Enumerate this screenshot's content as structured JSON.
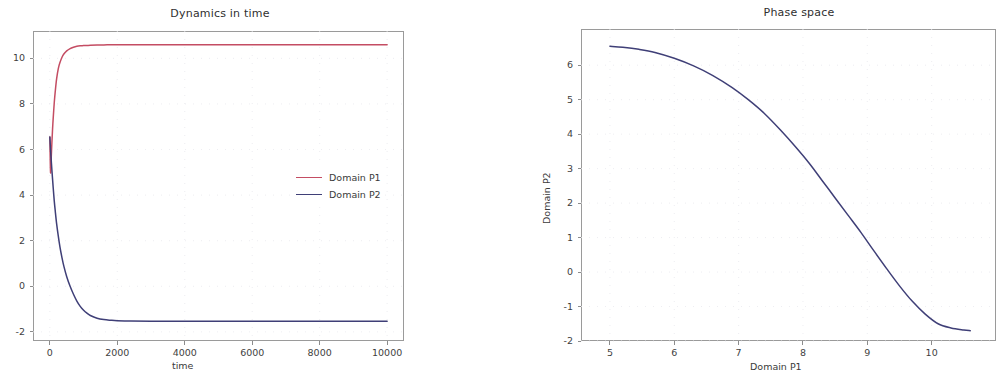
{
  "figure": {
    "width": 938,
    "height": 377,
    "background": "#ffffff"
  },
  "colors": {
    "p1": "#c44d63",
    "p2": "#3f3f77",
    "axis": "#9a9a9a",
    "grid": "#e8e8ee",
    "text": "#3a3a3a"
  },
  "chart_data": [
    {
      "type": "line",
      "id": "dynamics-in-time",
      "title": "Dynamics in time",
      "xlabel": "time",
      "ylabel": "",
      "xlim": [
        -500,
        10500
      ],
      "ylim": [
        -2.4,
        11.2
      ],
      "xticks": [
        0,
        2000,
        4000,
        6000,
        8000,
        10000
      ],
      "xtick_labels": [
        "0",
        "2000",
        "4000",
        "6000",
        "8000",
        "10000"
      ],
      "yticks": [
        -2,
        0,
        2,
        4,
        6,
        8,
        10
      ],
      "ytick_labels": [
        "-2",
        "0",
        "2",
        "4",
        "6",
        "8",
        "10"
      ],
      "grid": true,
      "legend_position": "center right",
      "series": [
        {
          "name": "Domain P1",
          "color": "#c44d63",
          "x": [
            0,
            20,
            40,
            60,
            80,
            100,
            130,
            160,
            200,
            250,
            300,
            360,
            420,
            500,
            600,
            700,
            800,
            900,
            1000,
            1200,
            1400,
            1600,
            1800,
            2000,
            2400,
            3000,
            4000,
            5000,
            6000,
            7000,
            8000,
            9000,
            10000
          ],
          "y": [
            6.55,
            5.0,
            5.62,
            6.3,
            6.9,
            7.4,
            8.05,
            8.55,
            9.1,
            9.55,
            9.82,
            10.05,
            10.2,
            10.33,
            10.43,
            10.49,
            10.53,
            10.55,
            10.56,
            10.58,
            10.59,
            10.59,
            10.6,
            10.6,
            10.6,
            10.6,
            10.6,
            10.6,
            10.6,
            10.6,
            10.6,
            10.6,
            10.6
          ]
        },
        {
          "name": "Domain P2",
          "color": "#3f3f77",
          "x": [
            0,
            20,
            40,
            60,
            80,
            100,
            130,
            160,
            200,
            250,
            300,
            360,
            420,
            500,
            600,
            700,
            800,
            900,
            1000,
            1100,
            1200,
            1400,
            1600,
            1800,
            2000,
            2400,
            3000,
            4000,
            5000,
            6000,
            7000,
            8000,
            9000,
            10000
          ],
          "y": [
            6.55,
            6.0,
            5.55,
            5.1,
            4.7,
            4.3,
            3.75,
            3.3,
            2.75,
            2.2,
            1.72,
            1.25,
            0.85,
            0.42,
            0.0,
            -0.35,
            -0.65,
            -0.88,
            -1.05,
            -1.18,
            -1.28,
            -1.4,
            -1.46,
            -1.49,
            -1.51,
            -1.52,
            -1.53,
            -1.53,
            -1.53,
            -1.53,
            -1.53,
            -1.53,
            -1.53,
            -1.53
          ]
        }
      ]
    },
    {
      "type": "line",
      "id": "phase-space",
      "title": "Phase space",
      "xlabel": "Domain P1",
      "ylabel": "Domain P2",
      "xlim": [
        4.55,
        11.0
      ],
      "ylim": [
        -2.0,
        7.05
      ],
      "xticks": [
        5,
        6,
        7,
        8,
        9,
        10
      ],
      "xtick_labels": [
        "5",
        "6",
        "7",
        "8",
        "9",
        "10"
      ],
      "yticks": [
        -2,
        -1,
        0,
        1,
        2,
        3,
        4,
        5,
        6
      ],
      "ytick_labels": [
        "-2",
        "-1",
        "0",
        "1",
        "2",
        "3",
        "4",
        "5",
        "6"
      ],
      "grid": true,
      "legend_position": "none",
      "series": [
        {
          "name": "trajectory",
          "color": "#3f3f77",
          "x": [
            5.0,
            5.2,
            5.45,
            5.7,
            6.0,
            6.3,
            6.6,
            6.9,
            7.15,
            7.4,
            7.65,
            7.9,
            8.1,
            8.3,
            8.5,
            8.7,
            8.9,
            9.1,
            9.3,
            9.5,
            9.7,
            9.9,
            10.1,
            10.3,
            10.5,
            10.6
          ],
          "y": [
            6.55,
            6.52,
            6.46,
            6.37,
            6.2,
            5.98,
            5.7,
            5.35,
            5.0,
            4.6,
            4.12,
            3.6,
            3.15,
            2.65,
            2.15,
            1.65,
            1.15,
            0.62,
            0.1,
            -0.4,
            -0.85,
            -1.22,
            -1.5,
            -1.62,
            -1.68,
            -1.7
          ]
        }
      ]
    }
  ]
}
